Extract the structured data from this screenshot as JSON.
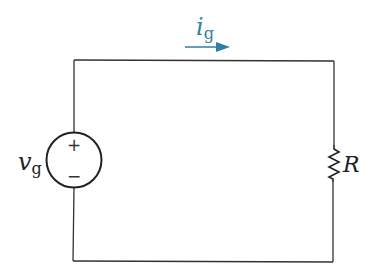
{
  "diagram": {
    "type": "circuit",
    "source": {
      "label": "v",
      "subscript": "g",
      "plus_sign": "+",
      "minus_sign": "−"
    },
    "resistor": {
      "label": "R"
    },
    "current": {
      "label": "i",
      "subscript": "g",
      "direction": "clockwise (left to right along top wire)",
      "color": "#2f7fa6"
    },
    "colors": {
      "wire": "#333333",
      "background": "#ffffff"
    }
  }
}
